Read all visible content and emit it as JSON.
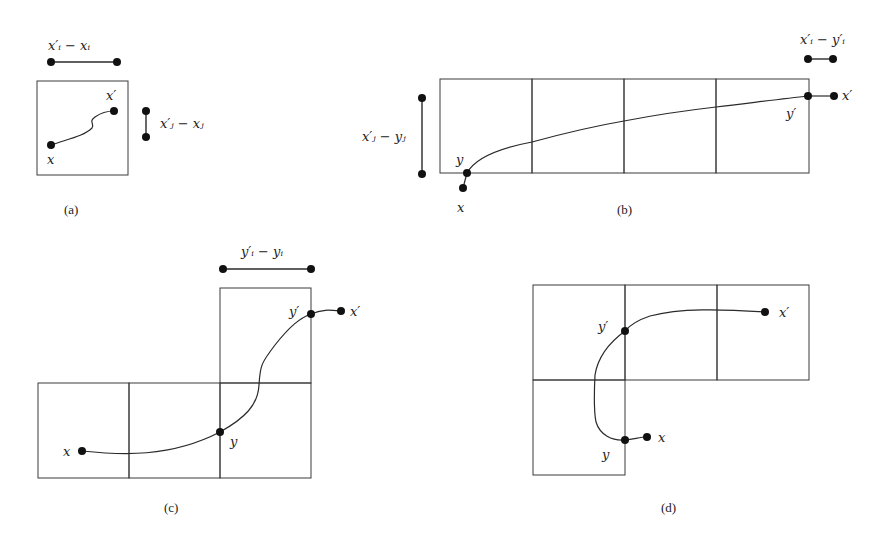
{
  "figure": {
    "panels": [
      {
        "id": "a",
        "caption": "(a)",
        "labels": {
          "start": "x",
          "end": "x′",
          "horizontal_extent": "x′ᵢ − xᵢ",
          "vertical_extent": "x′ⱼ − xⱼ"
        }
      },
      {
        "id": "b",
        "caption": "(b)",
        "labels": {
          "start": "x",
          "end": "x′",
          "grid_entry": "y",
          "grid_exit": "y′",
          "horizontal_extent": "x′ᵢ − y′ᵢ",
          "vertical_extent": "x′ⱼ − yⱼ"
        }
      },
      {
        "id": "c",
        "caption": "(c)",
        "labels": {
          "start": "x",
          "end": "x′",
          "grid_entry": "y",
          "grid_exit": "y′",
          "horizontal_extent": "y′ᵢ − yᵢ"
        }
      },
      {
        "id": "d",
        "caption": "(d)",
        "labels": {
          "start": "x",
          "end": "x′",
          "grid_entry": "y",
          "grid_exit": "y′"
        }
      }
    ]
  }
}
